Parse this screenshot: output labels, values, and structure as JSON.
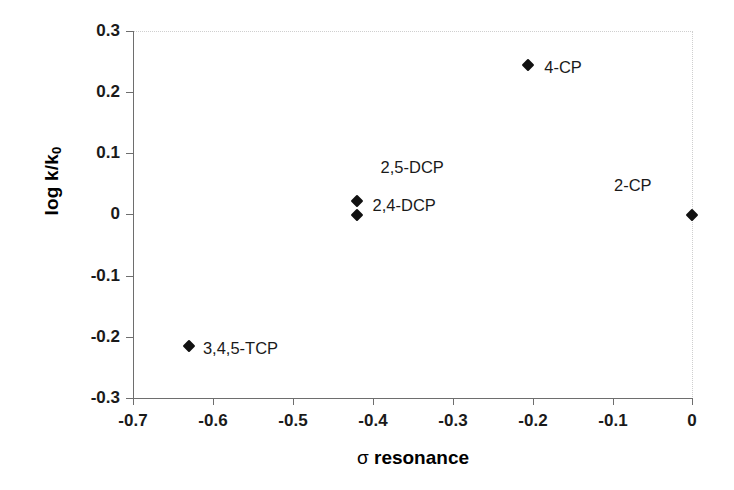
{
  "chart_data": {
    "type": "scatter",
    "title": "",
    "xlabel": "σ resonance",
    "ylabel": "log k/k0",
    "ylabel_main": "log k/k",
    "ylabel_sub": "0",
    "xlim": [
      -0.7,
      0.0
    ],
    "ylim": [
      -0.3,
      0.3
    ],
    "xticks": [
      "-0.7",
      "-0.6",
      "-0.5",
      "-0.4",
      "-0.3",
      "-0.2",
      "-0.1",
      "0"
    ],
    "xtick_values": [
      -0.7,
      -0.6,
      -0.5,
      -0.4,
      -0.3,
      -0.2,
      -0.1,
      0
    ],
    "yticks": [
      "0.3",
      "0.2",
      "0.1",
      "0",
      "-0.1",
      "-0.2",
      "-0.3"
    ],
    "ytick_values": [
      0.3,
      0.2,
      0.1,
      0,
      -0.1,
      -0.2,
      -0.3
    ],
    "grid": false,
    "legend": "none",
    "marker_shape": "diamond",
    "marker_color": "#111111",
    "points": [
      {
        "label": "3,4,5-TCP",
        "x": -0.63,
        "y": -0.215,
        "label_dx": 14,
        "label_dy": -6
      },
      {
        "label": "2,4-DCP",
        "x": -0.42,
        "y": 0.0,
        "label_dx": 16,
        "label_dy": -18
      },
      {
        "label": "2,5-DCP",
        "x": -0.42,
        "y": 0.022,
        "label_dx": 24,
        "label_dy": -42
      },
      {
        "label": "4-CP",
        "x": -0.205,
        "y": 0.245,
        "label_dx": 16,
        "label_dy": -6
      },
      {
        "label": "2-CP",
        "x": 0.0,
        "y": 0.0,
        "label_dx": -78,
        "label_dy": -38
      }
    ]
  },
  "axes": {
    "left_color": "#6e6e6e",
    "frame_dotted_color": "#cfcfcf",
    "background": "#ffffff"
  }
}
